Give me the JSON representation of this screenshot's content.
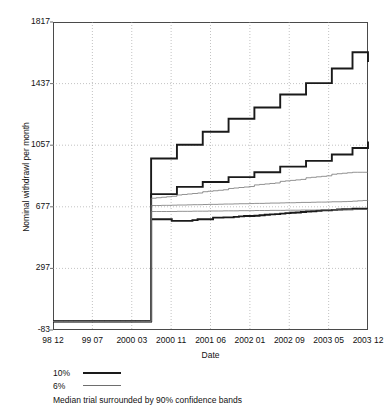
{
  "chart_data": {
    "type": "line",
    "title": "",
    "xlabel": "Date",
    "ylabel": "Nominal withdrawl per month",
    "ylim": [
      -83,
      1817
    ],
    "yticks": [
      1817,
      1437,
      1057,
      677,
      297,
      -83
    ],
    "xticks": [
      "98 12",
      "99 07",
      "2000 03",
      "2000 11",
      "2001 06",
      "2002 01",
      "2002 09",
      "2003 05",
      "2003 12"
    ],
    "grid": true,
    "legend_position": "below-plot",
    "annotation": "Median trial surrounded by 90% confidence bands",
    "legend": [
      {
        "label": "10%",
        "style": "thick",
        "color": "#1a1a1a"
      },
      {
        "label": "6%",
        "style": "thin",
        "color": "#6e6e6e"
      }
    ],
    "x": [
      0,
      1,
      2,
      3,
      4,
      5,
      6,
      7,
      8,
      9,
      10,
      11,
      12,
      13,
      14,
      15,
      16,
      17,
      18,
      19,
      20,
      21,
      22,
      23,
      24,
      25,
      26,
      27,
      28,
      29,
      30,
      31,
      32,
      33,
      34,
      35,
      36,
      37,
      38,
      39,
      40,
      41,
      42,
      43,
      44,
      45,
      46,
      47,
      48,
      49,
      50,
      51,
      52,
      53,
      54,
      55,
      56,
      57,
      58,
      59,
      60,
      61
    ],
    "series": [
      {
        "name": "10% upper",
        "style": "thick",
        "color": "#1a1a1a",
        "values": [
          -30,
          -30,
          -30,
          -30,
          -30,
          -30,
          -30,
          -30,
          -30,
          -30,
          -30,
          -30,
          -30,
          -30,
          -30,
          -30,
          -30,
          -30,
          -30,
          975,
          975,
          975,
          975,
          975,
          1060,
          1060,
          1060,
          1060,
          1060,
          1140,
          1140,
          1140,
          1140,
          1140,
          1220,
          1220,
          1220,
          1220,
          1220,
          1290,
          1290,
          1290,
          1290,
          1290,
          1370,
          1370,
          1370,
          1370,
          1370,
          1440,
          1440,
          1440,
          1440,
          1440,
          1530,
          1530,
          1530,
          1530,
          1630,
          1630,
          1630,
          1570
        ]
      },
      {
        "name": "10% median",
        "style": "thick",
        "color": "#1a1a1a",
        "values": [
          -30,
          -30,
          -30,
          -30,
          -30,
          -30,
          -30,
          -30,
          -30,
          -30,
          -30,
          -30,
          -30,
          -30,
          -30,
          -30,
          -30,
          -30,
          -30,
          755,
          755,
          755,
          755,
          755,
          800,
          800,
          800,
          800,
          800,
          830,
          830,
          830,
          830,
          830,
          860,
          860,
          860,
          860,
          860,
          890,
          890,
          890,
          890,
          890,
          925,
          925,
          925,
          925,
          925,
          960,
          960,
          960,
          960,
          960,
          1000,
          1000,
          1000,
          1000,
          1040,
          1040,
          1040,
          1080
        ]
      },
      {
        "name": "10% lower",
        "style": "thick",
        "color": "#1a1a1a",
        "values": [
          -30,
          -30,
          -30,
          -30,
          -30,
          -30,
          -30,
          -30,
          -30,
          -30,
          -30,
          -30,
          -30,
          -30,
          -30,
          -30,
          -30,
          -30,
          -30,
          600,
          600,
          600,
          600,
          590,
          590,
          590,
          590,
          595,
          600,
          600,
          600,
          610,
          610,
          612,
          612,
          615,
          618,
          620,
          620,
          622,
          625,
          628,
          630,
          632,
          635,
          638,
          640,
          642,
          645,
          648,
          650,
          652,
          655,
          655,
          658,
          660,
          662,
          662,
          665,
          665,
          665,
          665
        ]
      },
      {
        "name": "6% upper",
        "style": "thin",
        "color": "#6e6e6e",
        "values": [
          -30,
          -30,
          -30,
          -30,
          -30,
          -30,
          -30,
          -30,
          -30,
          -30,
          -30,
          -30,
          -30,
          -30,
          -30,
          -30,
          -30,
          -30,
          -30,
          730,
          733,
          736,
          739,
          742,
          750,
          753,
          756,
          759,
          762,
          770,
          773,
          776,
          779,
          782,
          790,
          793,
          796,
          799,
          802,
          812,
          815,
          818,
          821,
          824,
          834,
          837,
          840,
          843,
          846,
          856,
          859,
          862,
          865,
          868,
          878,
          881,
          884,
          887,
          890,
          890,
          890,
          890
        ]
      },
      {
        "name": "6% median",
        "style": "thin",
        "color": "#6e6e6e",
        "values": [
          -30,
          -30,
          -30,
          -30,
          -30,
          -30,
          -30,
          -30,
          -30,
          -30,
          -30,
          -30,
          -30,
          -30,
          -30,
          -30,
          -30,
          -30,
          -30,
          685,
          685,
          686,
          686,
          687,
          688,
          688,
          689,
          690,
          690,
          691,
          692,
          692,
          693,
          694,
          694,
          695,
          696,
          696,
          697,
          698,
          698,
          699,
          700,
          700,
          701,
          702,
          702,
          703,
          704,
          704,
          705,
          706,
          706,
          707,
          708,
          708,
          709,
          710,
          712,
          714,
          716,
          718
        ]
      },
      {
        "name": "6% lower",
        "style": "thin",
        "color": "#6e6e6e",
        "values": [
          -30,
          -30,
          -30,
          -30,
          -30,
          -30,
          -30,
          -30,
          -30,
          -30,
          -30,
          -30,
          -30,
          -30,
          -30,
          -30,
          -30,
          -30,
          -30,
          648,
          648,
          648,
          648,
          648,
          649,
          649,
          649,
          650,
          650,
          650,
          651,
          651,
          651,
          652,
          652,
          652,
          653,
          653,
          653,
          654,
          654,
          654,
          655,
          655,
          655,
          656,
          656,
          656,
          657,
          657,
          657,
          658,
          658,
          658,
          659,
          659,
          659,
          660,
          660,
          661,
          661,
          662
        ]
      }
    ]
  }
}
